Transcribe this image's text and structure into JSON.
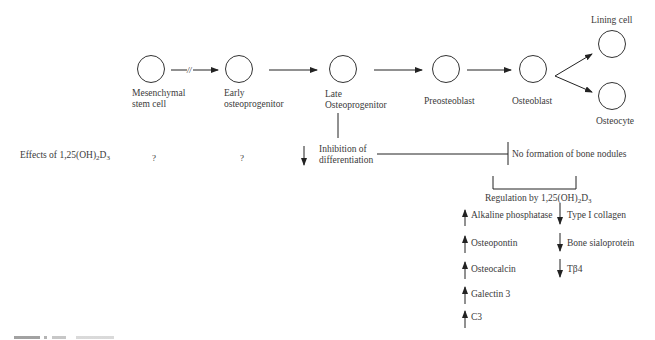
{
  "figure": {
    "lineage": [
      {
        "id": "msc",
        "label_lines": [
          "Mesenchymal",
          "stem cell"
        ]
      },
      {
        "id": "early",
        "label_lines": [
          "Early",
          "osteoprogenitor"
        ]
      },
      {
        "id": "late",
        "label_lines": [
          "Late",
          "Osteoprogenitor"
        ]
      },
      {
        "id": "preosteoblast",
        "label_lines": [
          "Preosteoblast"
        ]
      },
      {
        "id": "osteoblast",
        "label_lines": [
          "Osteoblast"
        ]
      },
      {
        "id": "lining",
        "label_lines": [
          "Lining cell"
        ]
      },
      {
        "id": "osteocyte",
        "label_lines": [
          "Osteocyte"
        ]
      }
    ],
    "break_mark": "//",
    "effects_row": {
      "label_prefix": "Effects of 1,25(OH)",
      "label_sub1": "2",
      "label_mid": "D",
      "label_sub2": "3",
      "msc_effect": "?",
      "early_effect": "?",
      "late_effect_lines": [
        "Inhibition of",
        "differentiation"
      ],
      "osteoblast_effect": "No formation of bone nodules"
    },
    "regulation": {
      "label_prefix": "Regulation by 1,25(OH)",
      "label_sub1": "2",
      "label_mid": "D",
      "label_sub2": "3",
      "upregulated": [
        "Alkaline phosphatase",
        "Osteopontin",
        "Osteocalcin",
        "Galectin 3",
        "C3"
      ],
      "downregulated": [
        "Type I collagen",
        "Bone sialoprotein",
        "Tβ4"
      ]
    },
    "caption": ""
  }
}
